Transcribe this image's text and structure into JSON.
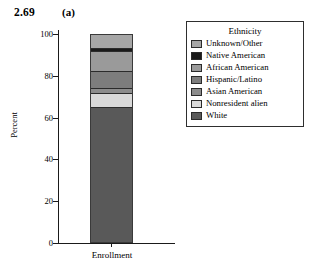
{
  "caption": {
    "number": "2.69",
    "panel": "(a)"
  },
  "chart_data": {
    "type": "bar",
    "title": "",
    "subtitle": "",
    "xlabel": "Enrollment",
    "ylabel": "Percent",
    "categories": [
      "Enrollment"
    ],
    "ylim": [
      0,
      100
    ],
    "yticks": [
      0,
      20,
      40,
      60,
      80,
      100
    ],
    "ytick_labels": [
      "0",
      "20",
      "40",
      "60",
      "80",
      "100"
    ],
    "grid": false,
    "stacked": true,
    "legend_position": "right",
    "legend_title": "Ethnicity",
    "series": [
      {
        "name": "White",
        "values": [
          65.0
        ],
        "color": "#595959"
      },
      {
        "name": "Nonresident alien",
        "values": [
          7.0
        ],
        "color": "#d9d9d9"
      },
      {
        "name": "Asian American",
        "values": [
          2.0
        ],
        "color": "#8c8c8c"
      },
      {
        "name": "Hispanic/Latino",
        "values": [
          8.5
        ],
        "color": "#7d7d7d"
      },
      {
        "name": "African American",
        "values": [
          9.5
        ],
        "color": "#9a9a9a"
      },
      {
        "name": "Native American",
        "values": [
          1.5
        ],
        "color": "#1a1a1a"
      },
      {
        "name": "Unknown/Other",
        "values": [
          6.5
        ],
        "color": "#a6a6a6"
      }
    ],
    "stack_order_top_to_bottom": [
      "Unknown/Other",
      "Native American",
      "African American",
      "Hispanic/Latino",
      "Asian American",
      "Nonresident alien",
      "White"
    ]
  },
  "legend": {
    "title": "Ethnicity",
    "items": [
      {
        "label": "Unknown/Other",
        "color": "#a6a6a6"
      },
      {
        "label": "Native American",
        "color": "#1a1a1a"
      },
      {
        "label": "African American",
        "color": "#9a9a9a"
      },
      {
        "label": "Hispanic/Latino",
        "color": "#7d7d7d"
      },
      {
        "label": "Asian American",
        "color": "#8c8c8c"
      },
      {
        "label": "Nonresident alien",
        "color": "#d9d9d9"
      },
      {
        "label": "White",
        "color": "#595959"
      }
    ]
  },
  "axes": {
    "y_label": "Percent",
    "x_label": "Enrollment",
    "y_ticks": [
      "100",
      "80",
      "60",
      "40",
      "20",
      "0"
    ]
  }
}
